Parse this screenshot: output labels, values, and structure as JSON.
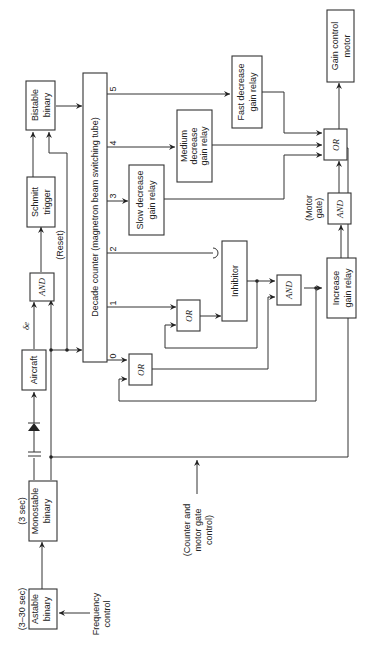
{
  "blocks": {
    "astable": {
      "line1": "Astable",
      "line2": "binary",
      "note": "(3–30 sec)"
    },
    "monostable": {
      "line1": "Monostable",
      "line2": "binary",
      "note": "(3 sec)"
    },
    "aircraft": {
      "label": "Aircraft",
      "signal": "δe"
    },
    "and_top": {
      "label": "AND",
      "note": "(Reset)"
    },
    "schmitt": {
      "line1": "Schmitt",
      "line2": "trigger"
    },
    "bistable": {
      "line1": "Bistable",
      "line2": "binary"
    },
    "decade_counter": {
      "label": "Decade counter (magnetron beam switching tube)"
    },
    "slow_decrease": {
      "line1": "Slow decrease",
      "line2": "gain relay"
    },
    "medium_decrease": {
      "line1": "Medium",
      "line2": "decrease",
      "line3": "gain relay"
    },
    "fast_decrease": {
      "line1": "Fast decrease",
      "line2": "gain relay"
    },
    "gain_motor": {
      "line1": "Gain control",
      "line2": "motor"
    },
    "or_final": {
      "label": "OR"
    },
    "and_motor": {
      "label": "AND",
      "note1": "(Motor",
      "note2": "gate)"
    },
    "increase_relay": {
      "line1": "Increase",
      "line2": "gain relay"
    },
    "and_inc": {
      "label": "AND"
    },
    "inhibitor": {
      "label": "Inhibitor"
    },
    "or_1": {
      "label": "OR"
    },
    "or_0": {
      "label": "OR"
    }
  },
  "outputs": {
    "o0": "0",
    "o1": "1",
    "o2": "2",
    "o3": "3",
    "o4": "4",
    "o5": "5"
  },
  "inputs": {
    "frequency": {
      "line1": "Frequency",
      "line2": "control"
    },
    "counter_gate": {
      "line1": "(Counter and",
      "line2": "motor gate",
      "line3": "control)"
    }
  }
}
